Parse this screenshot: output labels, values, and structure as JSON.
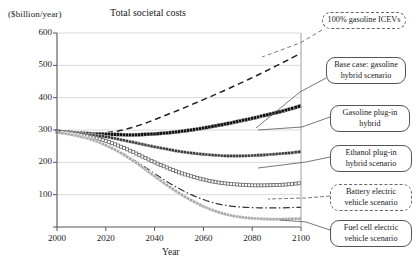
{
  "chart_data": {
    "type": "line",
    "title": "Total societal costs",
    "ylabel": "($billion/year)",
    "xlabel": "Year",
    "xlim": [
      2000,
      2100
    ],
    "ylim": [
      0,
      600
    ],
    "yticks": [
      0,
      100,
      200,
      300,
      400,
      500,
      600
    ],
    "ytick_labels": [
      "",
      "100",
      "200",
      "300",
      "400",
      "500",
      "600"
    ],
    "xticks": [
      2000,
      2020,
      2040,
      2060,
      2080,
      2100
    ],
    "xtick_labels": [
      "2000",
      "2020",
      "2040",
      "2060",
      "2080",
      "2100"
    ],
    "grid": "horizontal",
    "legend_position": "callouts-right",
    "x": [
      2000,
      2005,
      2010,
      2015,
      2020,
      2025,
      2030,
      2035,
      2040,
      2045,
      2050,
      2055,
      2060,
      2065,
      2070,
      2075,
      2080,
      2085,
      2090,
      2095,
      2100
    ],
    "series": [
      {
        "name": "100% gasoline ICEVs",
        "style": "dashed",
        "color": "#222222",
        "values": [
          296,
          294,
          292,
          291,
          292,
          297,
          306,
          318,
          332,
          347,
          362,
          378,
          394,
          410,
          427,
          444,
          462,
          480,
          499,
          518,
          538
        ]
      },
      {
        "name": "Base case: gasoline hybrid scenario",
        "style": "markers-thick",
        "color": "#111111",
        "values": [
          296,
          293,
          290,
          288,
          287,
          286,
          285,
          286,
          288,
          291,
          295,
          300,
          306,
          313,
          320,
          328,
          336,
          345,
          354,
          364,
          375
        ]
      },
      {
        "name": "Gasoline plug-in hybrid",
        "style": "markers-medium",
        "color": "#3a3a3a",
        "values": [
          296,
          292,
          288,
          284,
          279,
          272,
          264,
          256,
          248,
          241,
          234,
          229,
          225,
          222,
          220,
          220,
          221,
          223,
          226,
          229,
          233
        ]
      },
      {
        "name": "Ethanol plug-in hybrid scenario",
        "style": "markers-open",
        "color": "#6a6a6a",
        "values": [
          296,
          291,
          285,
          277,
          266,
          252,
          236,
          218,
          200,
          184,
          169,
          157,
          147,
          139,
          134,
          131,
          129,
          129,
          130,
          132,
          136
        ]
      },
      {
        "name": "Battery electric vehicle scenario",
        "style": "dash-dot",
        "color": "#333333",
        "values": [
          293,
          287,
          279,
          268,
          254,
          236,
          214,
          190,
          165,
          141,
          119,
          100,
          85,
          73,
          66,
          62,
          60,
          59,
          59,
          60,
          61
        ]
      },
      {
        "name": "Fuel cell electric vehicle scenario",
        "style": "markers-light",
        "color": "#a8a8a8",
        "values": [
          293,
          287,
          279,
          268,
          253,
          234,
          211,
          185,
          157,
          130,
          105,
          83,
          64,
          49,
          38,
          31,
          27,
          25,
          24,
          25,
          26
        ]
      }
    ]
  },
  "callouts": {
    "icev": "100% gasoline ICEVs",
    "base": "Base case: gasoline hybrid scenario",
    "gas_phev": "Gasoline plug-in hybrid",
    "eth_phev": "Ethanol plug-in hybrid scenario",
    "bev": "Battery electric vehicle scenario",
    "fcv": "Fuel cell electric vehicle scenario"
  }
}
